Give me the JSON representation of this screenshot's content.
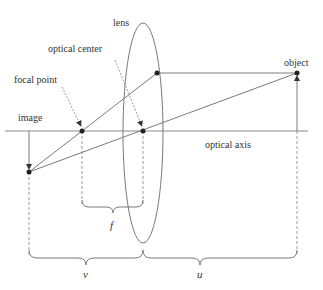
{
  "diagram": {
    "type": "thin-lens ray diagram",
    "labels": {
      "lens": "lens",
      "optical_center": "optical center",
      "focal_point": "focal point",
      "image": "image",
      "object": "object",
      "optical_axis": "optical axis",
      "f": "f",
      "v": "v",
      "u": "u"
    },
    "colors": {
      "line": "#7a7a7a",
      "dashed": "#9a9a9a",
      "point": "#222222",
      "text": "#333333",
      "background": "#ffffff"
    }
  }
}
